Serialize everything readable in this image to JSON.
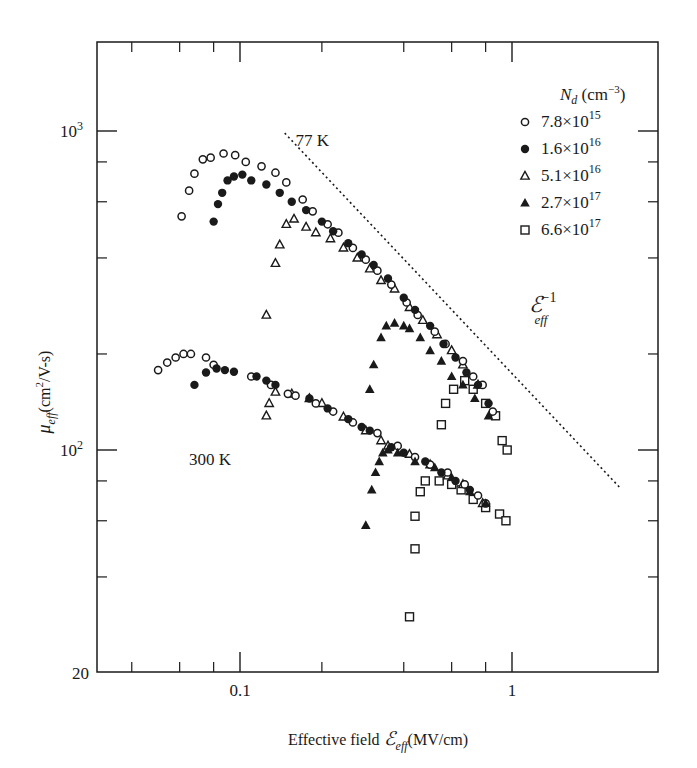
{
  "chart_data": {
    "type": "scatter",
    "title": "",
    "xlabel": "Effective field ℰeff (MV/cm)",
    "ylabel": "μeff (cm²/V-s)",
    "xscale": "log",
    "yscale": "log",
    "xlim": [
      0.03,
      3.2
    ],
    "ylim": [
      20,
      2000
    ],
    "grid": false,
    "x_ticks": [
      {
        "value": 0.1,
        "label": "0.1"
      },
      {
        "value": 1,
        "label": "1"
      }
    ],
    "x_minor_ticks": [
      0.04,
      0.06,
      0.08,
      0.2,
      0.4,
      0.6,
      0.8
    ],
    "y_ticks": [
      {
        "value": 20,
        "label": "20"
      },
      {
        "value": 100,
        "label": "10",
        "sup": "2"
      },
      {
        "value": 1000,
        "label": "10",
        "sup": "3"
      }
    ],
    "y_minor_ticks": [
      40,
      60,
      80,
      200,
      400,
      600,
      800
    ],
    "legend": {
      "title": "N",
      "title_sub": "d",
      "title_unit": "(cm",
      "title_unit_sup": "−3",
      "title_unit_end": ")",
      "position": "upper right",
      "entries": [
        {
          "marker": "open-circle",
          "label": "7.8×10",
          "sup": "15"
        },
        {
          "marker": "filled-circle",
          "label": "1.6×10",
          "sup": "16"
        },
        {
          "marker": "open-triangle",
          "label": "5.1×10",
          "sup": "16"
        },
        {
          "marker": "filled-triangle",
          "label": "2.7×10",
          "sup": "17"
        },
        {
          "marker": "open-square",
          "label": "6.6×10",
          "sup": "17"
        }
      ]
    },
    "annotations": [
      {
        "text": "77 K",
        "x": 0.16,
        "y": 900
      },
      {
        "text": "300 K",
        "x": 0.065,
        "y": 90
      },
      {
        "text": "ℰ",
        "sup": "−1",
        "sub": "eff",
        "x": 1.15,
        "y": 270
      }
    ],
    "reference_line": {
      "style": "dotted",
      "slope": -1,
      "label": "ℰeff^-1",
      "x": [
        0.146,
        2.5
      ],
      "y": [
        985,
        76
      ]
    },
    "series": [
      {
        "name": "7.8×10^15 (77 K)",
        "temperature": "77 K",
        "Nd": "7.8e15",
        "marker": "open-circle",
        "points": [
          [
            0.061,
            540
          ],
          [
            0.065,
            650
          ],
          [
            0.068,
            735
          ],
          [
            0.073,
            815
          ],
          [
            0.078,
            825
          ],
          [
            0.087,
            850
          ],
          [
            0.096,
            840
          ],
          [
            0.105,
            800
          ],
          [
            0.12,
            775
          ],
          [
            0.135,
            740
          ],
          [
            0.148,
            690
          ],
          [
            0.17,
            610
          ],
          [
            0.185,
            560
          ],
          [
            0.21,
            510
          ],
          [
            0.23,
            480
          ],
          [
            0.26,
            430
          ],
          [
            0.29,
            395
          ],
          [
            0.32,
            365
          ],
          [
            0.36,
            330
          ],
          [
            0.41,
            290
          ],
          [
            0.45,
            265
          ],
          [
            0.52,
            235
          ],
          [
            0.57,
            215
          ],
          [
            0.66,
            190
          ],
          [
            0.72,
            170
          ],
          [
            0.78,
            160
          ],
          [
            0.85,
            132
          ]
        ]
      },
      {
        "name": "1.6×10^16 (77 K)",
        "temperature": "77 K",
        "Nd": "1.6e16",
        "marker": "filled-circle",
        "points": [
          [
            0.08,
            520
          ],
          [
            0.083,
            590
          ],
          [
            0.086,
            640
          ],
          [
            0.09,
            700
          ],
          [
            0.095,
            720
          ],
          [
            0.102,
            730
          ],
          [
            0.11,
            700
          ],
          [
            0.125,
            680
          ],
          [
            0.14,
            640
          ],
          [
            0.155,
            600
          ],
          [
            0.175,
            565
          ],
          [
            0.2,
            520
          ],
          [
            0.22,
            485
          ],
          [
            0.25,
            445
          ],
          [
            0.28,
            410
          ],
          [
            0.31,
            380
          ],
          [
            0.35,
            345
          ],
          [
            0.4,
            300
          ],
          [
            0.44,
            275
          ],
          [
            0.5,
            245
          ],
          [
            0.56,
            215
          ],
          [
            0.62,
            195
          ],
          [
            0.68,
            175
          ],
          [
            0.75,
            160
          ],
          [
            0.82,
            140
          ]
        ]
      },
      {
        "name": "5.1×10^16 (77 K)",
        "temperature": "77 K",
        "Nd": "5.1e16",
        "marker": "open-triangle",
        "points": [
          [
            0.125,
            265
          ],
          [
            0.135,
            385
          ],
          [
            0.14,
            440
          ],
          [
            0.148,
            510
          ],
          [
            0.158,
            530
          ],
          [
            0.175,
            500
          ],
          [
            0.19,
            480
          ],
          [
            0.215,
            460
          ],
          [
            0.24,
            430
          ],
          [
            0.27,
            400
          ],
          [
            0.3,
            370
          ],
          [
            0.33,
            340
          ],
          [
            0.37,
            320
          ],
          [
            0.42,
            280
          ],
          [
            0.47,
            255
          ],
          [
            0.53,
            230
          ],
          [
            0.6,
            205
          ],
          [
            0.66,
            185
          ],
          [
            0.75,
            160
          ]
        ]
      },
      {
        "name": "2.7×10^17 (77 K)",
        "temperature": "77 K",
        "Nd": "2.7e17",
        "marker": "filled-triangle",
        "points": [
          [
            0.3,
            155
          ],
          [
            0.31,
            185
          ],
          [
            0.33,
            225
          ],
          [
            0.345,
            245
          ],
          [
            0.37,
            250
          ],
          [
            0.4,
            245
          ],
          [
            0.42,
            240
          ],
          [
            0.46,
            225
          ],
          [
            0.5,
            205
          ],
          [
            0.55,
            190
          ],
          [
            0.6,
            170
          ],
          [
            0.66,
            160
          ],
          [
            0.73,
            145
          ],
          [
            0.82,
            128
          ]
        ]
      },
      {
        "name": "6.6×10^17 (77 K)",
        "temperature": "77 K",
        "Nd": "6.6e17",
        "marker": "open-square",
        "points": [
          [
            0.55,
            120
          ],
          [
            0.57,
            140
          ],
          [
            0.61,
            155
          ],
          [
            0.67,
            165
          ],
          [
            0.72,
            155
          ],
          [
            0.8,
            140
          ],
          [
            0.87,
            128
          ],
          [
            0.92,
            107
          ],
          [
            0.96,
            100
          ]
        ]
      },
      {
        "name": "7.8×10^15 (300 K)",
        "temperature": "300 K",
        "Nd": "7.8e15",
        "marker": "open-circle",
        "points": [
          [
            0.05,
            178
          ],
          [
            0.054,
            188
          ],
          [
            0.058,
            195
          ],
          [
            0.062,
            200
          ],
          [
            0.066,
            200
          ],
          [
            0.075,
            195
          ],
          [
            0.08,
            185
          ],
          [
            0.11,
            170
          ],
          [
            0.13,
            160
          ],
          [
            0.15,
            150
          ],
          [
            0.16,
            148
          ],
          [
            0.19,
            140
          ],
          [
            0.22,
            132
          ],
          [
            0.26,
            122
          ],
          [
            0.32,
            113
          ],
          [
            0.38,
            103
          ],
          [
            0.44,
            95
          ],
          [
            0.5,
            90
          ],
          [
            0.58,
            85
          ],
          [
            0.67,
            78
          ],
          [
            0.75,
            72
          ],
          [
            0.8,
            68
          ]
        ]
      },
      {
        "name": "1.6×10^16 (300 K)",
        "temperature": "300 K",
        "Nd": "1.6e16",
        "marker": "filled-circle",
        "points": [
          [
            0.068,
            160
          ],
          [
            0.075,
            175
          ],
          [
            0.082,
            180
          ],
          [
            0.088,
            178
          ],
          [
            0.095,
            176
          ],
          [
            0.115,
            170
          ],
          [
            0.125,
            165
          ],
          [
            0.135,
            160
          ],
          [
            0.18,
            145
          ],
          [
            0.21,
            135
          ],
          [
            0.25,
            125
          ],
          [
            0.28,
            118
          ],
          [
            0.3,
            115
          ],
          [
            0.36,
            102
          ],
          [
            0.4,
            98
          ],
          [
            0.48,
            92
          ],
          [
            0.55,
            85
          ],
          [
            0.62,
            80
          ],
          [
            0.7,
            75
          ]
        ]
      },
      {
        "name": "5.1×10^16 (300 K)",
        "temperature": "300 K",
        "Nd": "5.1e16",
        "marker": "open-triangle",
        "points": [
          [
            0.125,
            128
          ],
          [
            0.128,
            140
          ],
          [
            0.135,
            152
          ],
          [
            0.155,
            150
          ],
          [
            0.18,
            145
          ],
          [
            0.2,
            140
          ],
          [
            0.24,
            127
          ],
          [
            0.29,
            115
          ],
          [
            0.33,
            107
          ],
          [
            0.35,
            103
          ],
          [
            0.42,
            97
          ],
          [
            0.5,
            90
          ],
          [
            0.58,
            83
          ],
          [
            0.66,
            78
          ],
          [
            0.78,
            68
          ]
        ]
      },
      {
        "name": "2.7×10^17 (300 K)",
        "temperature": "300 K",
        "Nd": "2.7e17",
        "marker": "filled-triangle",
        "points": [
          [
            0.29,
            58
          ],
          [
            0.305,
            75
          ],
          [
            0.315,
            85
          ],
          [
            0.325,
            92
          ],
          [
            0.335,
            98
          ],
          [
            0.35,
            100
          ],
          [
            0.38,
            98
          ],
          [
            0.44,
            92
          ],
          [
            0.52,
            88
          ],
          [
            0.6,
            82
          ],
          [
            0.7,
            74
          ],
          [
            0.8,
            68
          ]
        ]
      },
      {
        "name": "6.6×10^17 (300 K)",
        "temperature": "300 K",
        "Nd": "6.6e17",
        "marker": "open-square",
        "points": [
          [
            0.42,
            30
          ],
          [
            0.44,
            49
          ],
          [
            0.44,
            62
          ],
          [
            0.46,
            74
          ],
          [
            0.48,
            80
          ],
          [
            0.54,
            80
          ],
          [
            0.6,
            78
          ],
          [
            0.65,
            75
          ],
          [
            0.72,
            70
          ],
          [
            0.8,
            66
          ],
          [
            0.9,
            63
          ],
          [
            0.95,
            60
          ]
        ]
      }
    ]
  },
  "labels": {
    "xlabel_prefix": "Effective field ",
    "xlabel_symbol": "ℰ",
    "xlabel_sub": "eff",
    "xlabel_unit": "(MV/cm)",
    "ylabel_symbol": "μ",
    "ylabel_sub": "eff",
    "ylabel_unit_pre": "(cm",
    "ylabel_unit_sup": "2",
    "ylabel_unit_post": "/V-s)"
  }
}
